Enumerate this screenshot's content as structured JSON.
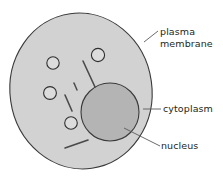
{
  "diagram": {
    "background_color": "#ffffff",
    "labels": {
      "plasma_membrane": {
        "line1": "plasma",
        "line2": "membrane"
      },
      "cytoplasm": {
        "text": "cytoplasm"
      },
      "nucleus": {
        "text": "nucleus"
      }
    },
    "colors": {
      "cytoplasm_fill": "#d2d2d2",
      "nucleus_fill": "#b4b4b4",
      "organelle_fill": "#dcdcdc",
      "outline": "#3a3a3a",
      "leader_line": "#5a5a5a",
      "text": "#231f20"
    },
    "structures": {
      "cell_body": "plasma-membrane-outline",
      "nucleus": "nucleus-circle",
      "vacuoles_count": 4,
      "rods_count": 4
    }
  }
}
